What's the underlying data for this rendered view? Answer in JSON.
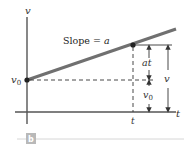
{
  "figure": {
    "axis_labels": {
      "vertical": "v",
      "horizontal": "t"
    },
    "intercept_label": "v",
    "intercept_subscript": "0",
    "slope_text": "Slope = ",
    "slope_symbol": "a",
    "time_mark_label": "t",
    "dimensions": {
      "at_label": "at",
      "v0_label": "v",
      "v0_subscript": "0",
      "v_label": "v"
    },
    "panel_label": "b",
    "colors": {
      "line": "#707070",
      "axes": "#555555",
      "badge": "#b9b9b9",
      "rule": "#d6d6d6"
    }
  }
}
